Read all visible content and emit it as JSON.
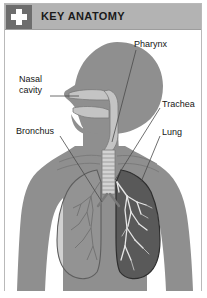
{
  "panel": {
    "header": {
      "title": "KEY ANATOMY",
      "icon": "medical-cross-icon",
      "icon_bg": "#6d6d6d",
      "bar_bg": "#b3b3b3",
      "title_color": "#1a1a1a"
    },
    "border_color": "#b9b9b9",
    "background": "#ffffff"
  },
  "figure": {
    "name": "respiratory-system-anatomy-illustration",
    "colors": {
      "body": "#8f8f8f",
      "body_outline": "#6f6f6f",
      "airway": "#c4c4c4",
      "airway_outline": "#7a7a7a",
      "lung_dark": "#595959",
      "lung_light": "#9a9a9a",
      "bronchi_light": "#e6e6e6",
      "bronchi_dark": "#6a6a6a",
      "leader_line": "#4a4a4a"
    },
    "labels": [
      {
        "id": "pharynx",
        "text": "Pharynx"
      },
      {
        "id": "nasal",
        "text_line1": "Nasal",
        "text_line2": "cavity"
      },
      {
        "id": "trachea",
        "text": "Trachea"
      },
      {
        "id": "bronchus",
        "text": "Bronchus"
      },
      {
        "id": "lung",
        "text": "Lung"
      }
    ]
  }
}
